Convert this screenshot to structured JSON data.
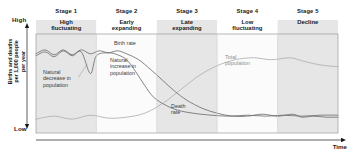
{
  "figure": {
    "background": "#ffffff"
  },
  "axes": {
    "y_high_label": "High",
    "y_low_label": "Low",
    "y_title_lines": [
      "Births and deaths",
      "per 1,000 people",
      "per year"
    ],
    "x_title": "Time",
    "arrow_color": "#1b1b1b",
    "border_color": "#9a9a9a"
  },
  "stages": [
    {
      "number": "Stage 1",
      "name_lines": [
        "High",
        "fluctuating"
      ],
      "shaded": true
    },
    {
      "number": "Stage 2",
      "name_lines": [
        "Early",
        "expanding"
      ],
      "shaded": false
    },
    {
      "number": "Stage 3",
      "name_lines": [
        "Late",
        "expanding"
      ],
      "shaded": true
    },
    {
      "number": "Stage 4",
      "name_lines": [
        "Low",
        "fluctuating"
      ],
      "shaded": false
    },
    {
      "number": "Stage 5",
      "name_lines": [
        "Decline"
      ],
      "shaded": true
    }
  ],
  "annotations": [
    {
      "id": "birth-rate",
      "lines": [
        "Birth rate"
      ],
      "color": "#3b3b3b"
    },
    {
      "id": "death-rate",
      "lines": [
        "Death",
        "rate"
      ],
      "color": "#3b3b3b"
    },
    {
      "id": "total-population",
      "lines": [
        "Total",
        "population"
      ],
      "color": "#8e8e8e"
    },
    {
      "id": "natural-decrease",
      "lines": [
        "Natural",
        "decrease in",
        "population"
      ],
      "color": "#3b3b3b"
    },
    {
      "id": "natural-increase",
      "lines": [
        "Natural",
        "increase in",
        "population"
      ],
      "color": "#3b3b3b"
    }
  ],
  "colors": {
    "band_shaded": "#e6e6e6",
    "band_plain": "#fbfbfb",
    "curve_birth": "#6f6f6f",
    "curve_death": "#6f6f6f",
    "curve_total": "#b3b3b3",
    "text_dark": "#1b1b1b",
    "text_note": "#3b3b3b",
    "text_gray": "#8e8e8e"
  },
  "chart_data": {
    "type": "line",
    "xlabel": "Time",
    "ylabel": "Births and deaths per 1,000 people per year",
    "xlim": [
      0,
      100
    ],
    "ylim": [
      0,
      100
    ],
    "grid": false,
    "legend": "inline-annotations",
    "x_tick_labels": [],
    "y_tick_labels": [
      "Low",
      "High"
    ],
    "stage_boundaries_pct": [
      0,
      20,
      40,
      60,
      80,
      100
    ],
    "series": [
      {
        "name": "Birth rate",
        "color": "#6f6f6f",
        "points": [
          [
            0,
            80
          ],
          [
            3,
            84
          ],
          [
            6,
            79
          ],
          [
            9,
            84
          ],
          [
            12,
            79
          ],
          [
            15,
            84
          ],
          [
            18,
            80
          ],
          [
            21,
            83
          ],
          [
            24,
            81
          ],
          [
            27,
            83
          ],
          [
            30,
            80
          ],
          [
            34,
            74
          ],
          [
            38,
            64
          ],
          [
            42,
            53
          ],
          [
            46,
            42
          ],
          [
            50,
            33
          ],
          [
            55,
            25
          ],
          [
            60,
            20
          ],
          [
            65,
            17
          ],
          [
            70,
            17
          ],
          [
            75,
            19
          ],
          [
            80,
            17
          ],
          [
            85,
            19
          ],
          [
            88,
            16
          ],
          [
            92,
            17
          ],
          [
            96,
            16
          ],
          [
            100,
            16
          ]
        ]
      },
      {
        "name": "Death rate",
        "color": "#6f6f6f",
        "points": [
          [
            0,
            78
          ],
          [
            3,
            82
          ],
          [
            6,
            77
          ],
          [
            9,
            83
          ],
          [
            12,
            78
          ],
          [
            15,
            82
          ],
          [
            18,
            60
          ],
          [
            20,
            78
          ],
          [
            24,
            81
          ],
          [
            27,
            79
          ],
          [
            30,
            74
          ],
          [
            33,
            62
          ],
          [
            36,
            48
          ],
          [
            39,
            36
          ],
          [
            43,
            28
          ],
          [
            47,
            23
          ],
          [
            52,
            20
          ],
          [
            58,
            18
          ],
          [
            64,
            17
          ],
          [
            70,
            18
          ],
          [
            76,
            17
          ],
          [
            82,
            18
          ],
          [
            88,
            17
          ],
          [
            94,
            18
          ],
          [
            100,
            18
          ]
        ]
      },
      {
        "name": "Total population",
        "color": "#b3b3b3",
        "points": [
          [
            0,
            14
          ],
          [
            6,
            17
          ],
          [
            12,
            14
          ],
          [
            18,
            18
          ],
          [
            24,
            15
          ],
          [
            30,
            16
          ],
          [
            36,
            20
          ],
          [
            42,
            30
          ],
          [
            48,
            44
          ],
          [
            54,
            58
          ],
          [
            60,
            68
          ],
          [
            66,
            74
          ],
          [
            72,
            76
          ],
          [
            78,
            74
          ],
          [
            84,
            76
          ],
          [
            88,
            73
          ],
          [
            92,
            70
          ],
          [
            96,
            68
          ],
          [
            100,
            67
          ]
        ]
      }
    ],
    "regions": [
      {
        "name": "Natural decrease in population",
        "between": [
          "Birth rate",
          "Death rate"
        ],
        "x_range": [
          15,
          21
        ]
      },
      {
        "name": "Natural increase in population",
        "between": [
          "Birth rate",
          "Death rate"
        ],
        "x_range": [
          30,
          60
        ]
      }
    ]
  }
}
